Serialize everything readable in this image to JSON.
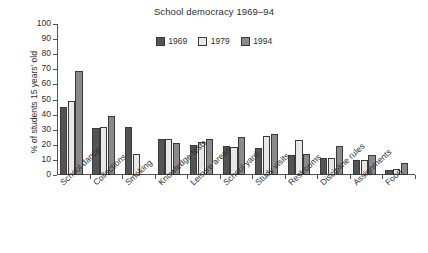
{
  "chart_data": {
    "type": "bar",
    "title": "School democracy 1969–94",
    "xlabel": "",
    "ylabel": "% of students 15 years' old",
    "ylim": [
      0,
      100
    ],
    "yticks": [
      0,
      10,
      20,
      30,
      40,
      50,
      60,
      70,
      80,
      90,
      100
    ],
    "grid": false,
    "legend_position": "top-center",
    "categories": [
      "School dance",
      "Collections",
      "Smoking",
      "Knowledge tests",
      "Leisure areas",
      "School yard",
      "Study visits",
      "Restrooms",
      "Discipline rules",
      "Assignments",
      "Food"
    ],
    "series": [
      {
        "name": "1969",
        "color": "#545454",
        "values": [
          45,
          31,
          32,
          24,
          20,
          19,
          18,
          13.5,
          11.5,
          10,
          3.5
        ]
      },
      {
        "name": "1979",
        "color": "#e8e8e8",
        "values": [
          49,
          31.5,
          14,
          24,
          22,
          18.5,
          26,
          23,
          11.5,
          10,
          4
        ]
      },
      {
        "name": "1994",
        "color": "#8a8a8a",
        "values": [
          69,
          39,
          null,
          21,
          24,
          25,
          27,
          14,
          19,
          13.5,
          8
        ]
      }
    ]
  },
  "colors": {
    "axis": "#545454",
    "text": "#2e2e2e",
    "background": "#ffffff",
    "series_1969": "#545454",
    "series_1979": "#e8e8e8",
    "series_1994": "#8a8a8a",
    "bar_border": "#3a3a3a"
  }
}
